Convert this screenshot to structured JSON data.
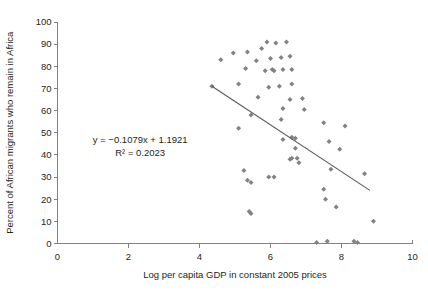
{
  "chart_data": {
    "type": "scatter",
    "title": "",
    "xlabel": "Log per capita GDP in constant 2005 prices",
    "ylabel": "Percent of African migrants who remain in Africa",
    "xlim": [
      0,
      10
    ],
    "ylim": [
      0,
      100
    ],
    "xticks": [
      "0",
      "2",
      "4",
      "6",
      "8",
      "10"
    ],
    "xtick_values": [
      0,
      2,
      4,
      6,
      8,
      10
    ],
    "yticks": [
      "0",
      "10",
      "20",
      "30",
      "40",
      "50",
      "60",
      "70",
      "80",
      "90",
      "100"
    ],
    "ytick_values": [
      0,
      10,
      20,
      30,
      40,
      50,
      60,
      70,
      80,
      90,
      100
    ],
    "grid": false,
    "legend": "none",
    "marker": "diamond",
    "marker_color": "#808285",
    "annotations": {
      "equation": "y = −0.1079x + 1.1921",
      "r_squared": "R² = 0.2023",
      "equation_x": 2.33,
      "equation_y": 45.5,
      "r_squared_y": 39.5
    },
    "trendline": {
      "slope": -10.79,
      "intercept": 119.21,
      "x_start": 4.35,
      "y_start": 71.0,
      "x_end": 8.8,
      "y_end": 24.0,
      "color": "#58595b"
    },
    "points": [
      [
        4.95,
        86.0
      ],
      [
        5.35,
        86.5
      ],
      [
        5.75,
        88.0
      ],
      [
        5.9,
        91.0
      ],
      [
        6.15,
        90.5
      ],
      [
        6.45,
        91.0
      ],
      [
        4.6,
        83.0
      ],
      [
        5.6,
        82.5
      ],
      [
        6.0,
        83.5
      ],
      [
        6.3,
        84.0
      ],
      [
        6.55,
        84.5
      ],
      [
        5.3,
        79.0
      ],
      [
        5.85,
        78.0
      ],
      [
        6.05,
        78.5
      ],
      [
        6.1,
        78.0
      ],
      [
        6.35,
        78.5
      ],
      [
        6.6,
        78.5
      ],
      [
        4.35,
        71.0
      ],
      [
        5.1,
        72.0
      ],
      [
        5.95,
        70.5
      ],
      [
        6.25,
        71.0
      ],
      [
        6.6,
        72.0
      ],
      [
        5.65,
        66.0
      ],
      [
        6.55,
        65.0
      ],
      [
        6.9,
        65.5
      ],
      [
        6.35,
        61.0
      ],
      [
        6.95,
        60.5
      ],
      [
        5.45,
        58.0
      ],
      [
        5.1,
        52.0
      ],
      [
        6.3,
        56.0
      ],
      [
        7.5,
        54.5
      ],
      [
        8.1,
        53.0
      ],
      [
        6.35,
        47.0
      ],
      [
        6.6,
        48.0
      ],
      [
        6.7,
        47.5
      ],
      [
        7.65,
        46.0
      ],
      [
        6.7,
        43.0
      ],
      [
        7.95,
        42.5
      ],
      [
        6.6,
        38.5
      ],
      [
        6.75,
        38.5
      ],
      [
        6.55,
        38.0
      ],
      [
        6.8,
        36.5
      ],
      [
        5.25,
        33.0
      ],
      [
        7.7,
        33.5
      ],
      [
        5.95,
        30.0
      ],
      [
        6.1,
        30.0
      ],
      [
        5.35,
        28.5
      ],
      [
        5.45,
        27.5
      ],
      [
        8.65,
        31.5
      ],
      [
        7.5,
        24.5
      ],
      [
        5.4,
        14.5
      ],
      [
        5.45,
        13.5
      ],
      [
        7.55,
        20.0
      ],
      [
        7.85,
        16.5
      ],
      [
        8.9,
        10.0
      ],
      [
        7.3,
        0.5
      ],
      [
        7.6,
        1.0
      ],
      [
        8.35,
        1.0
      ],
      [
        8.45,
        0.5
      ]
    ]
  }
}
